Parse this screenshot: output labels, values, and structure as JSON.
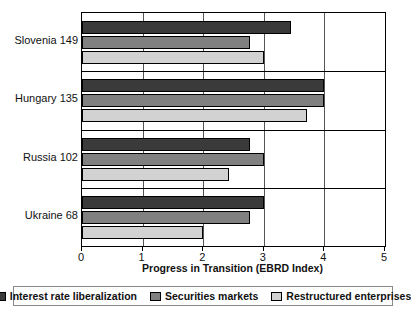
{
  "chart_data": {
    "type": "bar",
    "orientation": "horizontal",
    "title": "",
    "xlabel": "Progress in Transition (EBRD Index)",
    "ylabel": "",
    "xlim": [
      0,
      5
    ],
    "xticks": [
      "0",
      "1",
      "2",
      "3",
      "4",
      "5"
    ],
    "grid": true,
    "legend_position": "bottom",
    "categories": [
      "Slovenia 149",
      "Hungary 135",
      "Russia 102",
      "Ukraine 68"
    ],
    "series": [
      {
        "name": "Interest rate liberalization",
        "color": "#3a3a3a",
        "values": [
          3.45,
          4.0,
          2.78,
          3.0
        ]
      },
      {
        "name": "Securities markets",
        "color": "#808080",
        "values": [
          2.77,
          4.0,
          3.0,
          2.77
        ]
      },
      {
        "name": "Restructured enterprises",
        "color": "#d2d2d2",
        "values": [
          3.0,
          3.72,
          2.42,
          2.0
        ]
      }
    ]
  }
}
